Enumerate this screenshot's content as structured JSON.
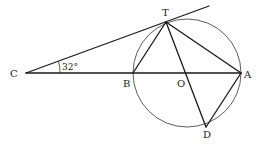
{
  "diagram": {
    "type": "geometry",
    "points": {
      "C": {
        "label": "C"
      },
      "T": {
        "label": "T"
      },
      "B": {
        "label": "B"
      },
      "O": {
        "label": "O"
      },
      "A": {
        "label": "A"
      },
      "D": {
        "label": "D"
      }
    },
    "angle_label": "32°",
    "angle_vertex": "C",
    "segments": [
      {
        "from": "C",
        "to": "T",
        "kind": "tangent"
      },
      {
        "from": "C",
        "to": "A",
        "kind": "line"
      },
      {
        "from": "T",
        "to": "B",
        "kind": "chord"
      },
      {
        "from": "T",
        "to": "A",
        "kind": "chord"
      },
      {
        "from": "T",
        "to": "D",
        "kind": "diameter"
      },
      {
        "from": "D",
        "to": "A",
        "kind": "chord"
      }
    ],
    "circle": {
      "center": "O",
      "through": [
        "T",
        "B",
        "A",
        "D"
      ]
    }
  }
}
